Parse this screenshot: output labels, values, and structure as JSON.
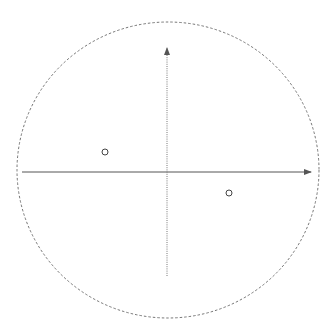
{
  "diagram": {
    "background": "#ffffff",
    "stroke_color": "#555555",
    "boundary_circle": {
      "cx": 168,
      "cy": 170,
      "rx": 151,
      "ry": 148,
      "style": "dashed"
    },
    "x_axis": {
      "x1": 22,
      "y1": 172,
      "x2": 311,
      "y2": 172,
      "style": "solid",
      "arrow": "right"
    },
    "y_axis": {
      "x1": 167,
      "y1": 276,
      "x2": 167,
      "y2": 48,
      "style": "dotted",
      "arrow": "up"
    },
    "points": [
      {
        "label": "point-1",
        "cx": 105,
        "cy": 152,
        "r": 3
      },
      {
        "label": "point-2",
        "cx": 229,
        "cy": 193,
        "r": 3
      }
    ]
  }
}
